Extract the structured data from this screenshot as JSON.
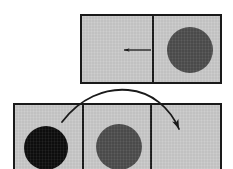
{
  "figure": {
    "background_color": "#ffffff",
    "width": 233,
    "height": 169,
    "panel_fill_color": "#c9c9c9",
    "panel_border_color": "#1a1a1a",
    "dark_disc_color": "#4d4d4d",
    "black_disc_color": "#0d0d0d",
    "arrow_color": "#1a1a1a"
  },
  "top_panel": {
    "name": "top frame",
    "cells": [
      {
        "label": "left cell",
        "content": "empty with leftward arrow"
      },
      {
        "label": "right cell",
        "content": "dark gray disc"
      }
    ],
    "disc": {
      "label": "dark gray disc",
      "color": "#4d4d4d",
      "cx": 188,
      "cy": 48,
      "r": 23
    },
    "arrow": {
      "label": "leftward motion arrow",
      "direction": "left",
      "from_x": 152,
      "to_x": 121,
      "y": 50
    }
  },
  "bottom_panel": {
    "name": "bottom frame",
    "cells": [
      {
        "label": "left cell",
        "content": "black disc"
      },
      {
        "label": "middle cell",
        "content": "dark gray disc"
      },
      {
        "label": "right cell",
        "content": "empty"
      }
    ],
    "discs": [
      {
        "label": "black disc",
        "color": "#0d0d0d",
        "cx": 44,
        "cy": 146,
        "r": 22
      },
      {
        "label": "dark gray disc",
        "color": "#4d4d4d",
        "cx": 117,
        "cy": 145,
        "r": 23
      }
    ]
  },
  "curved_arrow": {
    "label": "curved transfer arrow",
    "start_x": 62,
    "start_y": 122,
    "end_x": 182,
    "end_y": 133,
    "apex_y": 92,
    "color": "#1a1a1a"
  }
}
